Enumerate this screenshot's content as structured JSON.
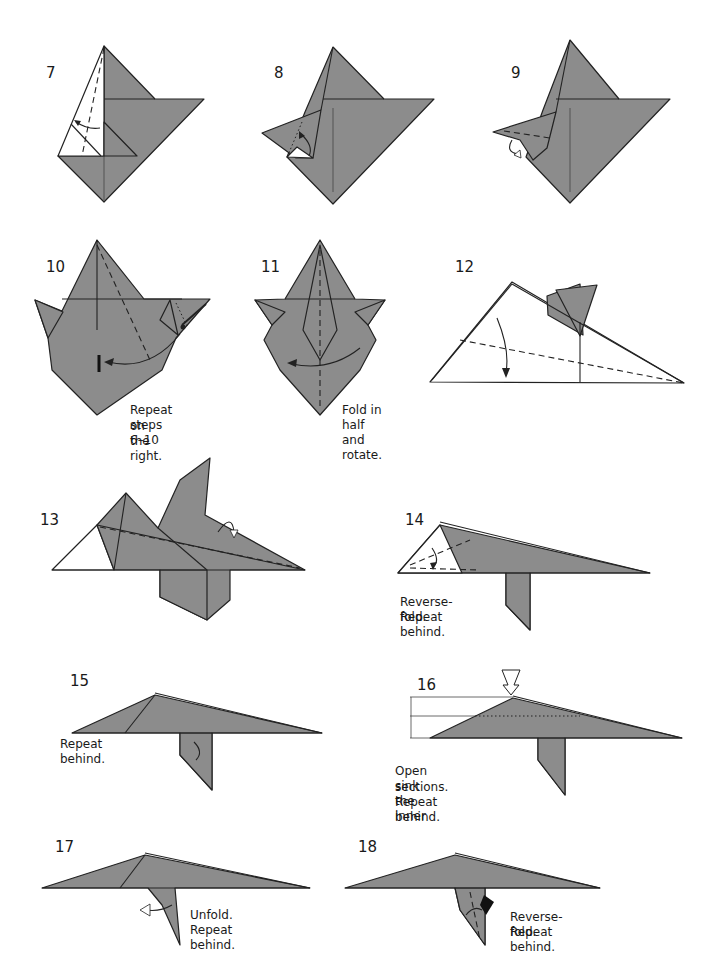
{
  "page": {
    "fill_color": "#8c8c8c",
    "line_color": "#222222",
    "background": "#ffffff"
  },
  "steps": [
    {
      "number": "7",
      "caption": ""
    },
    {
      "number": "8",
      "caption": ""
    },
    {
      "number": "9",
      "caption": ""
    },
    {
      "number": "10",
      "caption_line1": "Repeat steps 6–10",
      "caption_line2": "on the right."
    },
    {
      "number": "11",
      "caption": "Fold in half and rotate."
    },
    {
      "number": "12",
      "caption": ""
    },
    {
      "number": "13",
      "caption": ""
    },
    {
      "number": "14",
      "caption_line1": "Reverse-fold.",
      "caption_line2": "Repeat behind."
    },
    {
      "number": "15",
      "caption": "Repeat behind."
    },
    {
      "number": "16",
      "caption_line1": "Open sink the inner",
      "caption_line2": "sections. Repeat behind."
    },
    {
      "number": "17",
      "caption": "Unfold. Repeat behind."
    },
    {
      "number": "18",
      "caption_line1": "Reverse-fold.",
      "caption_line2": "Repeat behind."
    }
  ]
}
